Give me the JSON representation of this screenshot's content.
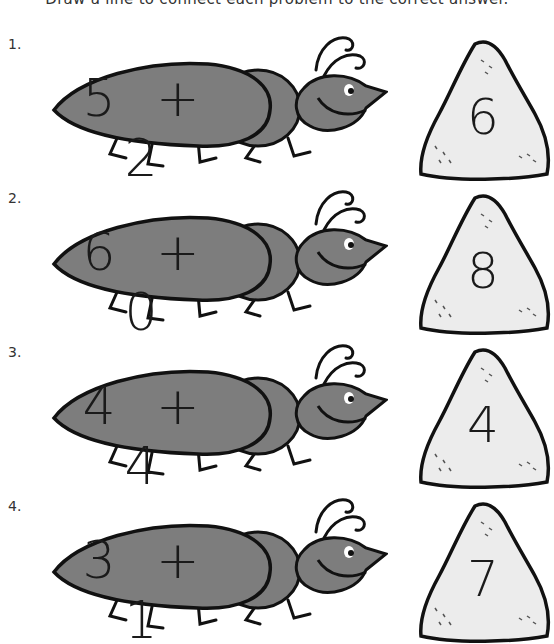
{
  "instruction": "Draw a line to connect each problem to the correct answer.",
  "colors": {
    "ant_body": "#7d7d7d",
    "ant_outline": "#111111",
    "rock_fill": "#ececec",
    "rock_outline": "#111111"
  },
  "problems": [
    {
      "number": "1.",
      "equation": "5 + 2",
      "answer": "6"
    },
    {
      "number": "2.",
      "equation": "6 + 0",
      "answer": "8"
    },
    {
      "number": "3.",
      "equation": "4 + 4",
      "answer": "4"
    },
    {
      "number": "4.",
      "equation": "3 + 1",
      "answer": "7"
    }
  ]
}
